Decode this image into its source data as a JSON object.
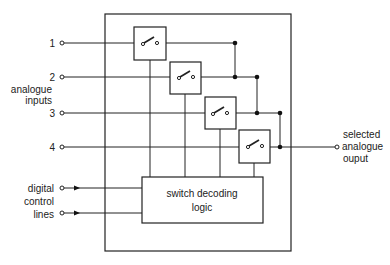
{
  "diagram": {
    "inputs": [
      {
        "label": "1",
        "y": 43
      },
      {
        "label": "2",
        "y": 77
      },
      {
        "label": "3",
        "y": 113
      },
      {
        "label": "4",
        "y": 147
      }
    ],
    "inputs_group_label_line1": "analogue",
    "inputs_group_label_line2": "inputs",
    "control_label_line1": "digital",
    "control_label_line2": "control",
    "control_label_line3": "lines",
    "logic_label_line1": "switch decoding",
    "logic_label_line2": "logic",
    "output_label_line1": "selected",
    "output_label_line2": "analogue",
    "output_label_line3": "ouput",
    "switch_count": 4,
    "colors": {
      "stroke": "#222222",
      "background": "#ffffff"
    }
  }
}
